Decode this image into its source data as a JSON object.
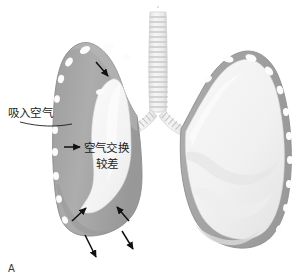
{
  "figure": {
    "panel_letter": "A",
    "kind": "medical-illustration"
  },
  "annotations": {
    "inhaled_air": {
      "label": "吸入空气",
      "name": "inhaled-air-label"
    },
    "poor_air_exchange": {
      "line1": "空气交换",
      "line2": "较差",
      "name": "poor-air-exchange-label"
    }
  },
  "colors": {
    "lung_tissue_gray": "#a9a9a9",
    "lung_tissue_gray_dark": "#8f8f8f",
    "lung_rim_gray": "#9b9b9b",
    "lung_pale_inner": "#f4f4f4",
    "lung_pale_mid": "#e8e8e8",
    "nodule_white": "#fdfdfd",
    "trachea_light": "#ededed",
    "trachea_ring": "#cfcfcf",
    "arrow_black": "#111111",
    "text_black": "#1c1c1c",
    "background": "#ffffff"
  },
  "arrows": {
    "inward": [
      {
        "name": "arrow-inward-top",
        "x1": 96,
        "y1": 62,
        "x2": 108,
        "y2": 76
      },
      {
        "name": "arrow-inward-left",
        "x1": 64,
        "y1": 147,
        "x2": 80,
        "y2": 147
      },
      {
        "name": "arrow-inward-bottom-left",
        "x1": 72,
        "y1": 221,
        "x2": 86,
        "y2": 208
      },
      {
        "name": "arrow-inward-bottom-right",
        "x1": 129,
        "y1": 221,
        "x2": 117,
        "y2": 207
      }
    ],
    "outward": [
      {
        "name": "arrow-outward-bottom-center",
        "x1": 85,
        "y1": 235,
        "x2": 96,
        "y2": 257
      },
      {
        "name": "arrow-outward-bottom-right",
        "x1": 122,
        "y1": 231,
        "x2": 133,
        "y2": 249
      }
    ]
  }
}
